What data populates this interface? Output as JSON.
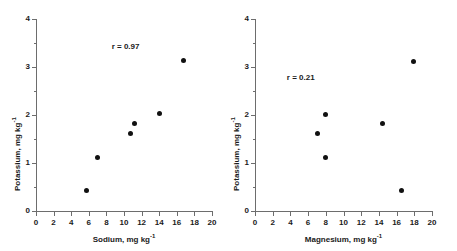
{
  "figure": {
    "panels": [
      {
        "id": "sodium-potassium",
        "annotation": "r = 0.97",
        "xlabel_text": "Sodium, mg kg",
        "xlabel_sup": "-1",
        "ylabel_text": "Potassium, mg kg",
        "ylabel_sup": "-1",
        "xticklabels": [
          "0",
          "2",
          "4",
          "6",
          "8",
          "10",
          "12",
          "14",
          "16",
          "18",
          "20"
        ],
        "yticklabels": [
          "0",
          "1",
          "2",
          "3",
          "4"
        ]
      },
      {
        "id": "magnesium-potassium",
        "annotation": "r = 0.21",
        "xlabel_text": "Magnesium, mg kg",
        "xlabel_sup": "-1",
        "ylabel_text": "Potassium, mg kg",
        "ylabel_sup": "-1",
        "xticklabels": [
          "0",
          "2",
          "4",
          "6",
          "8",
          "10",
          "12",
          "14",
          "16",
          "18",
          "20"
        ],
        "yticklabels": [
          "0",
          "1",
          "2",
          "3",
          "4"
        ]
      }
    ]
  },
  "chart_data": [
    {
      "type": "scatter",
      "title": "",
      "xlabel": "Sodium, mg kg-1",
      "ylabel": "Potassium, mg kg-1",
      "xlim": [
        0,
        20
      ],
      "ylim": [
        0,
        4
      ],
      "xticks": [
        0,
        2,
        4,
        6,
        8,
        10,
        12,
        14,
        16,
        18,
        20
      ],
      "yticks": [
        0,
        1,
        2,
        3,
        4
      ],
      "yticks_minor": [
        0.5,
        1.5,
        2.5,
        3.5
      ],
      "grid": false,
      "legend": "none",
      "annotations": [
        {
          "text": "r = 0.97",
          "x": 8.6,
          "y": 3.5
        }
      ],
      "correlation_r": 0.97,
      "marker": {
        "shape": "circle",
        "color": "#111111",
        "size": 5
      },
      "points": [
        {
          "x": 5.7,
          "y": 0.42
        },
        {
          "x": 7.0,
          "y": 1.12
        },
        {
          "x": 10.7,
          "y": 1.62
        },
        {
          "x": 11.2,
          "y": 1.83
        },
        {
          "x": 14.0,
          "y": 2.03
        },
        {
          "x": 16.8,
          "y": 3.13
        }
      ]
    },
    {
      "type": "scatter",
      "title": "",
      "xlabel": "Magnesium, mg kg-1",
      "ylabel": "Potassium, mg kg-1",
      "xlim": [
        0,
        20
      ],
      "ylim": [
        0,
        4
      ],
      "xticks": [
        0,
        2,
        4,
        6,
        8,
        10,
        12,
        14,
        16,
        18,
        20
      ],
      "yticks": [
        0,
        1,
        2,
        3,
        4
      ],
      "yticks_minor": [
        0.5,
        1.5,
        2.5,
        3.5
      ],
      "grid": false,
      "legend": "none",
      "annotations": [
        {
          "text": "r = 0.21",
          "x": 3.6,
          "y": 2.85
        }
      ],
      "correlation_r": 0.21,
      "marker": {
        "shape": "circle",
        "color": "#111111",
        "size": 5
      },
      "points": [
        {
          "x": 7.1,
          "y": 1.62
        },
        {
          "x": 8.0,
          "y": 2.01
        },
        {
          "x": 8.0,
          "y": 1.12
        },
        {
          "x": 14.4,
          "y": 1.83
        },
        {
          "x": 16.5,
          "y": 0.42
        },
        {
          "x": 17.9,
          "y": 3.11
        }
      ]
    }
  ]
}
